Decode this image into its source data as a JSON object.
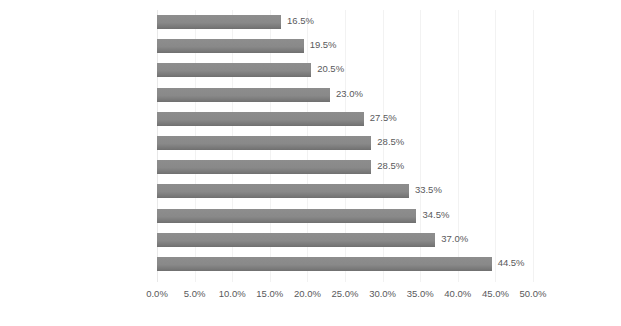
{
  "chart_data": {
    "type": "bar",
    "orientation": "horizontal",
    "title": "",
    "xlabel": "",
    "ylabel": "",
    "xlim": [
      0,
      50
    ],
    "x_tick_step": 5,
    "x_tick_labels": [
      "0.0%",
      "5.0%",
      "10.0%",
      "15.0%",
      "20.0%",
      "25.0%",
      "30.0%",
      "35.0%",
      "40.0%",
      "45.0%",
      "50.0%"
    ],
    "x_tick_values": [
      0,
      5,
      10,
      15,
      20,
      25,
      30,
      35,
      40,
      45,
      50
    ],
    "grid": true,
    "grid_axis": "x",
    "legend": false,
    "value_label_suffix": "%",
    "categories": [
      "Managing Demands",
      "Others",
      "Collecting Data",
      "Cross- Border Partners",
      "Tracking Deliveries",
      "Seamless Experience",
      "Managing Risk",
      "Cross-Border Returns",
      "Managing Expectation",
      "Cross-Border Logistics",
      "Navigation Customs"
    ],
    "values": [
      16.5,
      19.5,
      20.5,
      23.0,
      27.5,
      28.5,
      28.5,
      33.5,
      34.5,
      37.0,
      44.5
    ],
    "value_labels": [
      "16.5%",
      "19.5%",
      "20.5%",
      "23.0%",
      "27.5%",
      "28.5%",
      "28.5%",
      "33.5%",
      "34.5%",
      "37.0%",
      "44.5%"
    ],
    "bar_color": "#898989",
    "text_color": "#59595b",
    "gridline_color": "#f2f2f2",
    "background_color": "#ffffff"
  }
}
